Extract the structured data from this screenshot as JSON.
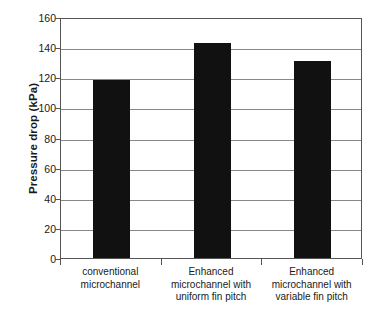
{
  "chart_data": {
    "type": "bar",
    "title": "",
    "subtitle": "",
    "xlabel": "",
    "ylabel": "Pressure drop (kPa)",
    "ylim": [
      0,
      160
    ],
    "ytick_step": 20,
    "yticks": [
      "0",
      "20",
      "40",
      "60",
      "80",
      "100",
      "120",
      "140",
      "160"
    ],
    "ytick_values": [
      0,
      20,
      40,
      60,
      80,
      100,
      120,
      140,
      160
    ],
    "grid": true,
    "grid_axis": "y",
    "legend": "none",
    "bar_color": "#111111",
    "gridline_color": "#888888",
    "frame_color": "#555555",
    "background_color": "#ffffff",
    "categories": [
      "conventional microchannel",
      "Enhanced microchannel with uniform fin pitch",
      "Enhanced microchannel with variable fin pitch"
    ],
    "category_lines": [
      [
        "conventional",
        "microchannel"
      ],
      [
        "Enhanced",
        "microchannel with",
        "uniform fin pitch"
      ],
      [
        "Enhanced",
        "microchannel with",
        "variable fin pitch"
      ]
    ],
    "values": [
      118,
      143,
      131
    ],
    "units": "kPa"
  }
}
